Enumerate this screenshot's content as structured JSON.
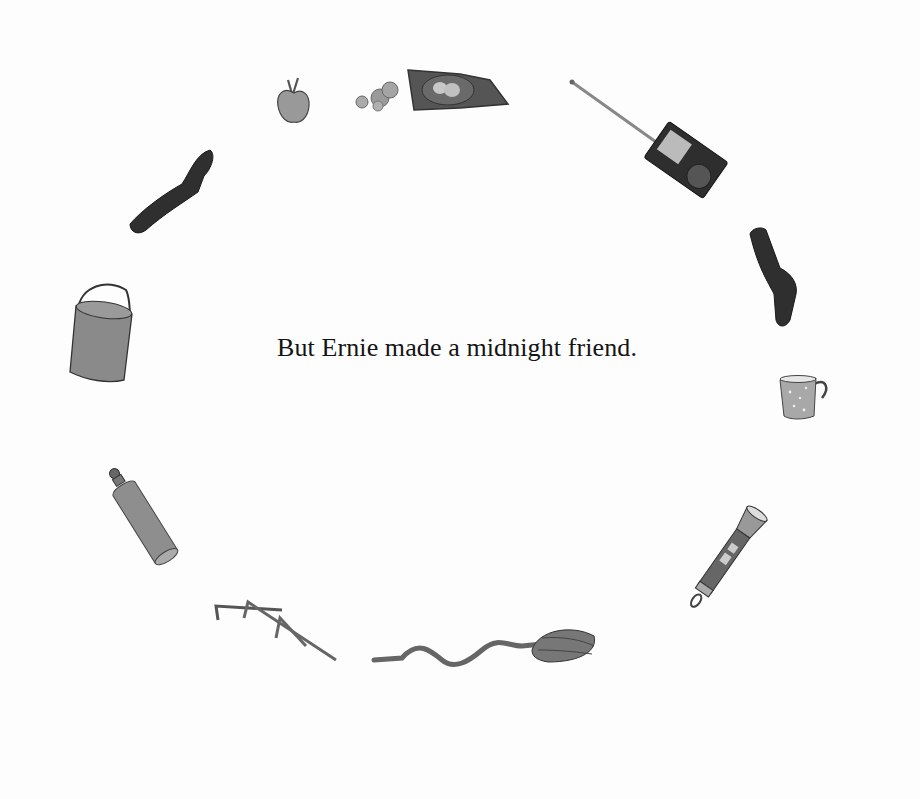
{
  "page": {
    "caption": "But Ernie made a midnight friend.",
    "illustrations": [
      {
        "name": "apple"
      },
      {
        "name": "bag of chips"
      },
      {
        "name": "walkie-talkie radio"
      },
      {
        "name": "sock (left)"
      },
      {
        "name": "sock (right)"
      },
      {
        "name": "bucket"
      },
      {
        "name": "enamel mug"
      },
      {
        "name": "water bottle"
      },
      {
        "name": "flashlight"
      },
      {
        "name": "tent stakes"
      },
      {
        "name": "spoon"
      }
    ]
  }
}
